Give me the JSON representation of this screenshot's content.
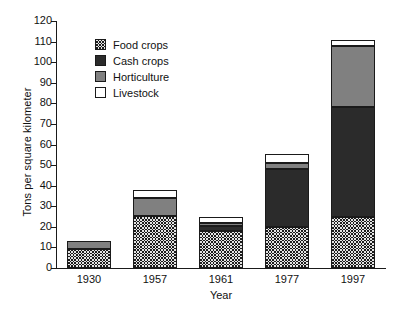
{
  "chart_data": {
    "type": "bar",
    "subtype": "stacked",
    "title": "",
    "xlabel": "Year",
    "ylabel": "Tons per square kilometer",
    "categories": [
      "1930",
      "1957",
      "1961",
      "1977",
      "1997"
    ],
    "ylim": [
      0,
      120
    ],
    "yticks": [
      0,
      10,
      20,
      30,
      40,
      50,
      60,
      70,
      80,
      90,
      100,
      110,
      120
    ],
    "grid": false,
    "legend_position": "inside-top-left",
    "series": [
      {
        "name": "Food crops",
        "color": "#1b1b1b",
        "pattern": "checkerboard",
        "values": [
          9.0,
          25.5,
          18.0,
          20.0,
          25.0
        ]
      },
      {
        "name": "Cash crops",
        "color": "#2b2b2b",
        "pattern": "solid-dark",
        "values": [
          0.0,
          0.0,
          2.5,
          28.0,
          53.0
        ]
      },
      {
        "name": "Horticulture",
        "color": "#808080",
        "pattern": "solid-gray",
        "values": [
          4.0,
          8.5,
          1.5,
          3.0,
          30.0
        ]
      },
      {
        "name": "Livestock",
        "color": "#ffffff",
        "pattern": "open",
        "values": [
          0.0,
          4.0,
          3.0,
          4.5,
          3.0
        ]
      }
    ],
    "totals": [
      13.0,
      38.0,
      25.0,
      55.5,
      111.0
    ]
  },
  "legend": {
    "items": [
      {
        "label": "Food crops"
      },
      {
        "label": "Cash crops"
      },
      {
        "label": "Horticulture"
      },
      {
        "label": "Livestock"
      }
    ]
  }
}
